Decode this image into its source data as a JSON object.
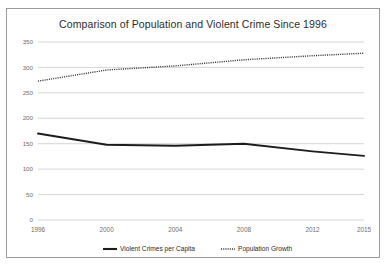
{
  "chart_data": {
    "type": "line",
    "title": "Comparison of Population and Violent Crime Since 1996",
    "xlabel": "",
    "ylabel": "",
    "x": [
      1996,
      2000,
      2004,
      2008,
      2012,
      2015
    ],
    "categories": [
      "1996",
      "2000",
      "2004",
      "2008",
      "2012",
      "2015"
    ],
    "xtick_labels": [
      "1996",
      "2000",
      "2004",
      "2008",
      "2012",
      "2015"
    ],
    "ytick_labels": [
      "0",
      "50",
      "100",
      "150",
      "200",
      "250",
      "300",
      "350"
    ],
    "yticks": [
      0,
      50,
      100,
      150,
      200,
      250,
      300,
      350
    ],
    "ylim": [
      0,
      350
    ],
    "xlim": [
      1996,
      2015
    ],
    "grid": "horizontal",
    "legend_position": "bottom",
    "series": [
      {
        "name": "Violent Crimes per Capita",
        "style": "solid",
        "color": "#1c1c1c",
        "values": [
          170,
          148,
          146,
          150,
          135,
          126
        ]
      },
      {
        "name": "Population Growth",
        "style": "dotted",
        "color": "#3a3a3a",
        "values": [
          273,
          295,
          303,
          315,
          323,
          328
        ]
      }
    ]
  },
  "legend": {
    "items": [
      {
        "label": "Violent Crimes per Capita"
      },
      {
        "label": "Population Growth"
      }
    ]
  }
}
